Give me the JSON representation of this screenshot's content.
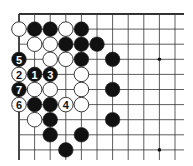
{
  "diagram": {
    "type": "go-board-corner",
    "corner": "top-left",
    "columns": 11,
    "rows": 10,
    "colors": {
      "black": "#111111",
      "white": "#ffffff",
      "line": "#333333",
      "background": "#ffffff"
    },
    "star_points": [
      {
        "col": 9,
        "row": 3
      },
      {
        "col": 9,
        "row": 9
      }
    ],
    "stones": [
      {
        "col": 0,
        "row": 1,
        "color": "white"
      },
      {
        "col": 1,
        "row": 1,
        "color": "black"
      },
      {
        "col": 2,
        "row": 1,
        "color": "black"
      },
      {
        "col": 3,
        "row": 1,
        "color": "white"
      },
      {
        "col": 4,
        "row": 1,
        "color": "black"
      },
      {
        "col": 1,
        "row": 2,
        "color": "white"
      },
      {
        "col": 2,
        "row": 2,
        "color": "white"
      },
      {
        "col": 3,
        "row": 2,
        "color": "black"
      },
      {
        "col": 4,
        "row": 2,
        "color": "black"
      },
      {
        "col": 5,
        "row": 2,
        "color": "black"
      },
      {
        "col": 0,
        "row": 3,
        "color": "black",
        "label": "5"
      },
      {
        "col": 2,
        "row": 3,
        "color": "white"
      },
      {
        "col": 3,
        "row": 3,
        "color": "white"
      },
      {
        "col": 4,
        "row": 3,
        "color": "black"
      },
      {
        "col": 6,
        "row": 3,
        "color": "black"
      },
      {
        "col": 0,
        "row": 4,
        "color": "white",
        "label": "2"
      },
      {
        "col": 1,
        "row": 4,
        "color": "black",
        "label": "1"
      },
      {
        "col": 2,
        "row": 4,
        "color": "black",
        "label": "3"
      },
      {
        "col": 4,
        "row": 4,
        "color": "white"
      },
      {
        "col": 0,
        "row": 5,
        "color": "black",
        "label": "7"
      },
      {
        "col": 1,
        "row": 5,
        "color": "white"
      },
      {
        "col": 2,
        "row": 5,
        "color": "white"
      },
      {
        "col": 4,
        "row": 5,
        "color": "white"
      },
      {
        "col": 6,
        "row": 5,
        "color": "black"
      },
      {
        "col": 0,
        "row": 6,
        "color": "white",
        "label": "6"
      },
      {
        "col": 1,
        "row": 6,
        "color": "black"
      },
      {
        "col": 2,
        "row": 6,
        "color": "black"
      },
      {
        "col": 3,
        "row": 6,
        "color": "white",
        "label": "4"
      },
      {
        "col": 4,
        "row": 6,
        "color": "white"
      },
      {
        "col": 1,
        "row": 7,
        "color": "white"
      },
      {
        "col": 2,
        "row": 7,
        "color": "black"
      },
      {
        "col": 6,
        "row": 7,
        "color": "black"
      },
      {
        "col": 2,
        "row": 8,
        "color": "black"
      },
      {
        "col": 4,
        "row": 8,
        "color": "black"
      },
      {
        "col": 3,
        "row": 9,
        "color": "black"
      }
    ]
  }
}
